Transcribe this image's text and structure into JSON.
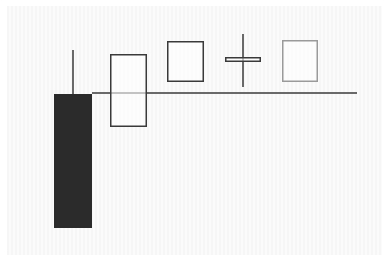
{
  "diagram": {
    "title": "",
    "colors": {
      "background": "#f8f8f8",
      "dark_fill": "#2b2b2b",
      "stroke": "#3a3a3a",
      "light_stroke": "#9a9a9a",
      "reference_line": "#3a3a3a"
    },
    "reference_line": {
      "x1": 92,
      "x2": 357,
      "y": 93
    },
    "candles": [
      {
        "name": "dark-long-candle",
        "type": "bearish",
        "filled": true,
        "body": {
          "x": 54,
          "y": 94,
          "w": 38,
          "h": 134
        },
        "wick": {
          "x": 73,
          "y1": 50,
          "y2": 94
        }
      },
      {
        "name": "hollow-tall-candle",
        "type": "bullish",
        "filled": false,
        "body": {
          "x": 110,
          "y": 54,
          "w": 37,
          "h": 73
        }
      },
      {
        "name": "hollow-square-candle",
        "type": "bullish",
        "filled": false,
        "body": {
          "x": 167,
          "y": 41,
          "w": 37,
          "h": 41
        }
      },
      {
        "name": "doji-candle",
        "type": "doji",
        "filled": false,
        "body": {
          "x": 225,
          "y": 57,
          "w": 36,
          "h": 5
        },
        "wick": {
          "x": 243,
          "y1": 34,
          "y2": 87
        }
      },
      {
        "name": "faded-square-candle",
        "type": "bullish",
        "filled": false,
        "faded": true,
        "body": {
          "x": 282,
          "y": 40,
          "w": 36,
          "h": 42
        }
      }
    ]
  }
}
